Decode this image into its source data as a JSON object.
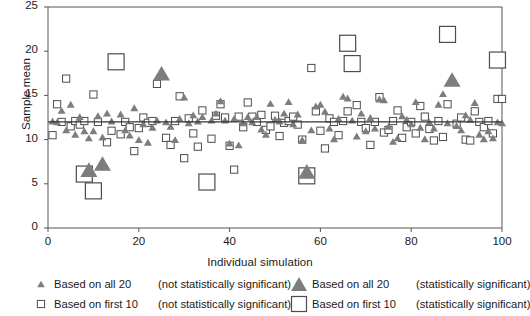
{
  "chart_data": {
    "type": "scatter",
    "title": "",
    "xlabel": "Individual simulation",
    "ylabel": "Sample mean",
    "xlim": [
      0,
      100
    ],
    "ylim": [
      0,
      25
    ],
    "xticks": [
      0,
      20,
      40,
      60,
      80,
      100
    ],
    "yticks": [
      0,
      5,
      10,
      15,
      20,
      25
    ],
    "grid": false,
    "reference_line": {
      "y": 12,
      "orientation": "horizontal",
      "color": "#333333"
    },
    "colors": {
      "triangle_fill": "#7d7d7d",
      "square_stroke": "#4d4d4d",
      "axis": "#555555",
      "reference_line": "#333333"
    },
    "series": [
      {
        "name": "Based on all 20 (not statistically significant)",
        "marker": "triangle",
        "size": "small",
        "points": [
          [
            1,
            12.1
          ],
          [
            2,
            12.0
          ],
          [
            3,
            13.3
          ],
          [
            4,
            11.1
          ],
          [
            5,
            14.0
          ],
          [
            6,
            10.6
          ],
          [
            7,
            12.6
          ],
          [
            8,
            11.0
          ],
          [
            9,
            10.2
          ],
          [
            10,
            11.0
          ],
          [
            11,
            12.7
          ],
          [
            12,
            10.3
          ],
          [
            13,
            13.0
          ],
          [
            14,
            12.1
          ],
          [
            16,
            12.9
          ],
          [
            17,
            11.1
          ],
          [
            18,
            10.5
          ],
          [
            19,
            13.6
          ],
          [
            20,
            10.0
          ],
          [
            21,
            11.8
          ],
          [
            22,
            9.7
          ],
          [
            23,
            11.4
          ],
          [
            24,
            12.2
          ],
          [
            26,
            12.0
          ],
          [
            27,
            11.5
          ],
          [
            28,
            10.0
          ],
          [
            29,
            12.4
          ],
          [
            30,
            14.8
          ],
          [
            31,
            11.9
          ],
          [
            32,
            12.8
          ],
          [
            33,
            12.1
          ],
          [
            34,
            12.6
          ],
          [
            36,
            12.2
          ],
          [
            37,
            13.0
          ],
          [
            38,
            14.4
          ],
          [
            39,
            12.2
          ],
          [
            40,
            9.6
          ],
          [
            41,
            12.4
          ],
          [
            42,
            9.4
          ],
          [
            43,
            11.9
          ],
          [
            44,
            12.6
          ],
          [
            45,
            12.0
          ],
          [
            46,
            12.6
          ],
          [
            47,
            11.2
          ],
          [
            48,
            10.6
          ],
          [
            49,
            14.1
          ],
          [
            50,
            12.3
          ],
          [
            51,
            12.1
          ],
          [
            52,
            13.0
          ],
          [
            53,
            14.3
          ],
          [
            54,
            11.8
          ],
          [
            55,
            12.9
          ],
          [
            56,
            10.0
          ],
          [
            58,
            11.1
          ],
          [
            59,
            13.8
          ],
          [
            60,
            14.0
          ],
          [
            61,
            13.2
          ],
          [
            62,
            11.3
          ],
          [
            63,
            10.1
          ],
          [
            64,
            12.4
          ],
          [
            65,
            14.9
          ],
          [
            66,
            14.7
          ],
          [
            67,
            12.2
          ],
          [
            68,
            10.4
          ],
          [
            69,
            13.0
          ],
          [
            70,
            11.0
          ],
          [
            71,
            12.5
          ],
          [
            72,
            11.3
          ],
          [
            73,
            14.6
          ],
          [
            74,
            14.5
          ],
          [
            75,
            11.5
          ],
          [
            76,
            9.8
          ],
          [
            77,
            10.2
          ],
          [
            78,
            12.7
          ],
          [
            79,
            12.3
          ],
          [
            80,
            11.8
          ],
          [
            81,
            14.3
          ],
          [
            82,
            11.4
          ],
          [
            83,
            10.1
          ],
          [
            84,
            12.0
          ],
          [
            85,
            11.3
          ],
          [
            86,
            14.0
          ],
          [
            87,
            15.2
          ],
          [
            88,
            11.9
          ],
          [
            90,
            11.6
          ],
          [
            91,
            11.1
          ],
          [
            92,
            12.8
          ],
          [
            93,
            12.3
          ],
          [
            94,
            14.2
          ],
          [
            95,
            10.6
          ],
          [
            96,
            10.1
          ],
          [
            97,
            11.0
          ],
          [
            98,
            10.2
          ],
          [
            99,
            12.0
          ],
          [
            100,
            11.9
          ]
        ]
      },
      {
        "name": "Based on all 20 (statistically significant)",
        "marker": "triangle",
        "size": "large",
        "points": [
          [
            9,
            6.6
          ],
          [
            12,
            7.3
          ],
          [
            25,
            17.5
          ],
          [
            57,
            6.4
          ],
          [
            89,
            16.8
          ]
        ]
      },
      {
        "name": "Based on first 10 (not statistically significant)",
        "marker": "square",
        "size": "small",
        "points": [
          [
            1,
            10.5
          ],
          [
            2,
            14.0
          ],
          [
            3,
            12.0
          ],
          [
            4,
            16.9
          ],
          [
            5,
            11.5
          ],
          [
            6,
            12.1
          ],
          [
            7,
            11.7
          ],
          [
            8,
            12.1
          ],
          [
            10,
            15.1
          ],
          [
            11,
            12.0
          ],
          [
            13,
            9.7
          ],
          [
            14,
            11.0
          ],
          [
            16,
            10.6
          ],
          [
            17,
            12.0
          ],
          [
            18,
            11.4
          ],
          [
            19,
            8.7
          ],
          [
            20,
            11.3
          ],
          [
            21,
            12.5
          ],
          [
            22,
            11.9
          ],
          [
            23,
            12.1
          ],
          [
            24,
            16.3
          ],
          [
            26,
            10.2
          ],
          [
            27,
            9.4
          ],
          [
            28,
            12.1
          ],
          [
            29,
            14.9
          ],
          [
            30,
            7.9
          ],
          [
            31,
            12.4
          ],
          [
            32,
            10.7
          ],
          [
            33,
            9.2
          ],
          [
            34,
            13.3
          ],
          [
            36,
            10.1
          ],
          [
            37,
            12.7
          ],
          [
            38,
            14.0
          ],
          [
            39,
            12.5
          ],
          [
            40,
            9.3
          ],
          [
            41,
            6.6
          ],
          [
            42,
            12.6
          ],
          [
            43,
            11.4
          ],
          [
            44,
            14.2
          ],
          [
            45,
            12.6
          ],
          [
            46,
            12.0
          ],
          [
            47,
            12.8
          ],
          [
            48,
            11.1
          ],
          [
            49,
            11.5
          ],
          [
            50,
            12.7
          ],
          [
            51,
            10.4
          ],
          [
            52,
            11.9
          ],
          [
            53,
            12.1
          ],
          [
            54,
            12.6
          ],
          [
            55,
            11.7
          ],
          [
            56,
            10.0
          ],
          [
            58,
            18.1
          ],
          [
            59,
            13.2
          ],
          [
            60,
            11.0
          ],
          [
            61,
            9.0
          ],
          [
            62,
            12.4
          ],
          [
            63,
            12.0
          ],
          [
            64,
            10.5
          ],
          [
            65,
            12.1
          ],
          [
            66,
            13.2
          ],
          [
            68,
            13.9
          ],
          [
            69,
            12.0
          ],
          [
            70,
            11.3
          ],
          [
            71,
            9.4
          ],
          [
            72,
            12.0
          ],
          [
            73,
            14.8
          ],
          [
            74,
            10.8
          ],
          [
            75,
            11.1
          ],
          [
            76,
            12.1
          ],
          [
            77,
            13.3
          ],
          [
            78,
            10.2
          ],
          [
            79,
            11.4
          ],
          [
            80,
            12.0
          ],
          [
            81,
            10.7
          ],
          [
            82,
            13.8
          ],
          [
            83,
            12.6
          ],
          [
            84,
            11.2
          ],
          [
            85,
            9.9
          ],
          [
            86,
            12.1
          ],
          [
            87,
            10.3
          ],
          [
            88,
            14.0
          ],
          [
            90,
            11.8
          ],
          [
            91,
            12.5
          ],
          [
            92,
            10.0
          ],
          [
            93,
            9.9
          ],
          [
            94,
            13.2
          ],
          [
            95,
            12.0
          ],
          [
            96,
            11.4
          ],
          [
            97,
            12.1
          ],
          [
            98,
            10.7
          ],
          [
            99,
            14.6
          ],
          [
            100,
            14.6
          ]
        ]
      },
      {
        "name": "Based on first 10 (statistically significant)",
        "marker": "square",
        "size": "large",
        "points": [
          [
            8,
            6.1
          ],
          [
            10,
            4.2
          ],
          [
            15,
            18.8
          ],
          [
            35,
            5.2
          ],
          [
            57,
            5.9
          ],
          [
            66,
            20.9
          ],
          [
            67,
            18.6
          ],
          [
            88,
            21.9
          ],
          [
            99,
            19.0
          ]
        ]
      }
    ]
  },
  "legend": {
    "entries": [
      {
        "name": "Based on all 20",
        "significance": "(not statistically significant)",
        "marker": "triangle",
        "size": "small"
      },
      {
        "name": "Based on all 20",
        "significance": "(statistically significant)",
        "marker": "triangle",
        "size": "large"
      },
      {
        "name": "Based on first 10",
        "significance": "(not statistically significant)",
        "marker": "square",
        "size": "small"
      },
      {
        "name": "Based on first 10",
        "significance": "(statistically significant)",
        "marker": "square",
        "size": "large"
      }
    ]
  }
}
